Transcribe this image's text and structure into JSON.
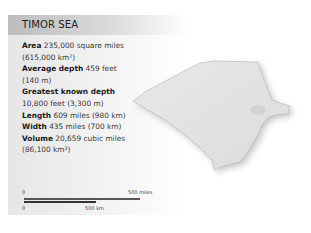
{
  "title": "TIMOR SEA",
  "stats": [
    {
      "label": "Area",
      "value": "235,000 square miles",
      "value2": "(615,000 km²)"
    },
    {
      "label": "Average depth",
      "value": "459 feet",
      "value2": "(140 m)"
    },
    {
      "label": "Greatest known depth",
      "value": "",
      "value2": "10,800 feet (3,300 m)"
    },
    {
      "label": "Length",
      "value": "609 miles (980 km)",
      "value2": ""
    },
    {
      "label": "Width",
      "value": "435 miles (700 km)",
      "value2": ""
    },
    {
      "label": "Volume",
      "value": "20,659 cubic miles",
      "value2": "(86,100 km³)"
    }
  ],
  "scale": {
    "miles_zero": "0",
    "miles_label": "500 miles",
    "km_zero": "0",
    "km_label": "500 km"
  },
  "colors": {
    "header": "#bdbdbd",
    "panel": "#e6e6e6",
    "sea": "#e3e3e3"
  }
}
